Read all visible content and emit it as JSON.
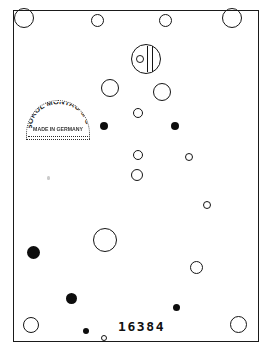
{
  "document": {
    "type": "scanned-punch-card",
    "serial_number": "16384",
    "background_color": "#ffffff",
    "ink_color": "#101010"
  },
  "border": {
    "label": "card-outline"
  },
  "stamp": {
    "arc_text": "SOKOL MONTAG & Co",
    "made_in_text": "MADE IN GERMANY",
    "shape": "dome"
  },
  "marked_hole": {
    "label": "marked-hole"
  },
  "holes": [
    {
      "name": "hole-top-left",
      "x": 24,
      "y": 18,
      "d": 20,
      "fill": "open"
    },
    {
      "name": "hole-top-mid-left",
      "x": 97,
      "y": 20,
      "d": 13,
      "fill": "open"
    },
    {
      "name": "hole-top-mid-right",
      "x": 165,
      "y": 20,
      "d": 13,
      "fill": "open"
    },
    {
      "name": "hole-top-right",
      "x": 232,
      "y": 18,
      "d": 20,
      "fill": "open"
    },
    {
      "name": "hole-upper-center-left",
      "x": 110,
      "y": 88,
      "d": 18,
      "fill": "open"
    },
    {
      "name": "hole-upper-center-right",
      "x": 162,
      "y": 92,
      "d": 18,
      "fill": "open"
    },
    {
      "name": "hole-mid-small-center",
      "x": 138,
      "y": 113,
      "d": 10,
      "fill": "open"
    },
    {
      "name": "hole-mid-dot-left",
      "x": 104,
      "y": 126,
      "d": 8,
      "fill": "filled"
    },
    {
      "name": "hole-mid-dot-right",
      "x": 175,
      "y": 126,
      "d": 8,
      "fill": "filled"
    },
    {
      "name": "hole-mid-small-lower",
      "x": 138,
      "y": 155,
      "d": 10,
      "fill": "open"
    },
    {
      "name": "hole-mid-small-right",
      "x": 189,
      "y": 157,
      "d": 8,
      "fill": "open"
    },
    {
      "name": "hole-center-below",
      "x": 137,
      "y": 175,
      "d": 12,
      "fill": "open"
    },
    {
      "name": "hole-right-small-upper",
      "x": 207,
      "y": 205,
      "d": 8,
      "fill": "open"
    },
    {
      "name": "hole-center-large",
      "x": 105,
      "y": 240,
      "d": 24,
      "fill": "open"
    },
    {
      "name": "hole-left-dot-upper",
      "x": 33,
      "y": 252,
      "d": 13,
      "fill": "filled"
    },
    {
      "name": "hole-right-mid",
      "x": 196,
      "y": 267,
      "d": 13,
      "fill": "open"
    },
    {
      "name": "hole-left-dot-lower",
      "x": 71,
      "y": 298,
      "d": 11,
      "fill": "filled"
    },
    {
      "name": "hole-right-dot-lower",
      "x": 176,
      "y": 307,
      "d": 7,
      "fill": "filled"
    },
    {
      "name": "hole-bottom-left",
      "x": 31,
      "y": 325,
      "d": 16,
      "fill": "open"
    },
    {
      "name": "hole-bottom-tiny-dot",
      "x": 86,
      "y": 331,
      "d": 6,
      "fill": "filled"
    },
    {
      "name": "hole-bottom-tiny-open",
      "x": 104,
      "y": 338,
      "d": 6,
      "fill": "open"
    },
    {
      "name": "hole-bottom-right",
      "x": 238,
      "y": 324,
      "d": 17,
      "fill": "open"
    }
  ],
  "marked_hole_geometry": {
    "x": 146,
    "y": 59,
    "d": 30
  }
}
